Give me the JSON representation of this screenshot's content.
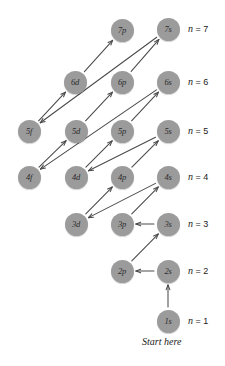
{
  "diagram": {
    "start_note": "Start here",
    "node_diameter": 23,
    "node_color": "#9b9b9b",
    "arrow_color": "#4a4a4a",
    "background": "#ffffff",
    "nodes": [
      {
        "id": "7p",
        "label": "7p",
        "x": 122,
        "y": 30
      },
      {
        "id": "7s",
        "label": "7s",
        "x": 168,
        "y": 29
      },
      {
        "id": "6d",
        "label": "6d",
        "x": 75,
        "y": 82
      },
      {
        "id": "6p",
        "label": "6p",
        "x": 122,
        "y": 82
      },
      {
        "id": "6s",
        "label": "6s",
        "x": 168,
        "y": 82
      },
      {
        "id": "5f",
        "label": "5f",
        "x": 29,
        "y": 131
      },
      {
        "id": "5d",
        "label": "5d",
        "x": 76,
        "y": 131
      },
      {
        "id": "5p",
        "label": "5p",
        "x": 122,
        "y": 131
      },
      {
        "id": "5s",
        "label": "5s",
        "x": 168,
        "y": 131
      },
      {
        "id": "4f",
        "label": "4f",
        "x": 29,
        "y": 177
      },
      {
        "id": "4d",
        "label": "4d",
        "x": 76,
        "y": 177
      },
      {
        "id": "4p",
        "label": "4p",
        "x": 122,
        "y": 177
      },
      {
        "id": "4s",
        "label": "4s",
        "x": 168,
        "y": 177
      },
      {
        "id": "3d",
        "label": "3d",
        "x": 76,
        "y": 224
      },
      {
        "id": "3p",
        "label": "3p",
        "x": 122,
        "y": 224
      },
      {
        "id": "3s",
        "label": "3s",
        "x": 168,
        "y": 224
      },
      {
        "id": "2p",
        "label": "2p",
        "x": 122,
        "y": 271
      },
      {
        "id": "2s",
        "label": "2s",
        "x": 168,
        "y": 271
      },
      {
        "id": "1s",
        "label": "1s",
        "x": 168,
        "y": 321
      }
    ],
    "shell_labels": [
      {
        "id": "n7",
        "n_symbol": "n",
        "eq": "= 7",
        "x": 188,
        "y": 29
      },
      {
        "id": "n6",
        "n_symbol": "n",
        "eq": "= 6",
        "x": 188,
        "y": 82
      },
      {
        "id": "n5",
        "n_symbol": "n",
        "eq": "= 5",
        "x": 188,
        "y": 131
      },
      {
        "id": "n4",
        "n_symbol": "n",
        "eq": "= 4",
        "x": 188,
        "y": 177
      },
      {
        "id": "n3",
        "n_symbol": "n",
        "eq": "= 3",
        "x": 188,
        "y": 224
      },
      {
        "id": "n2",
        "n_symbol": "n",
        "eq": "= 2",
        "x": 188,
        "y": 271
      },
      {
        "id": "n1",
        "n_symbol": "n",
        "eq": "= 1",
        "x": 188,
        "y": 321
      }
    ],
    "start_note_pos": {
      "x": 168,
      "y": 342
    },
    "arrows": [
      {
        "from": "1s",
        "to": "2s"
      },
      {
        "from": "2s",
        "to": "2p"
      },
      {
        "from": "2p",
        "to": "3s"
      },
      {
        "from": "3s",
        "to": "3p"
      },
      {
        "from": "3p",
        "to": "4s"
      },
      {
        "from": "4s",
        "to": "3d"
      },
      {
        "from": "3d",
        "to": "4p"
      },
      {
        "from": "4p",
        "to": "5s"
      },
      {
        "from": "5s",
        "to": "4d"
      },
      {
        "from": "4d",
        "to": "5p"
      },
      {
        "from": "5p",
        "to": "6s"
      },
      {
        "from": "6s",
        "to": "4f"
      },
      {
        "from": "4f",
        "to": "5d"
      },
      {
        "from": "5d",
        "to": "6p"
      },
      {
        "from": "6p",
        "to": "7s"
      },
      {
        "from": "7s",
        "to": "5f"
      },
      {
        "from": "5f",
        "to": "6d"
      },
      {
        "from": "6d",
        "to": "7p"
      }
    ]
  }
}
